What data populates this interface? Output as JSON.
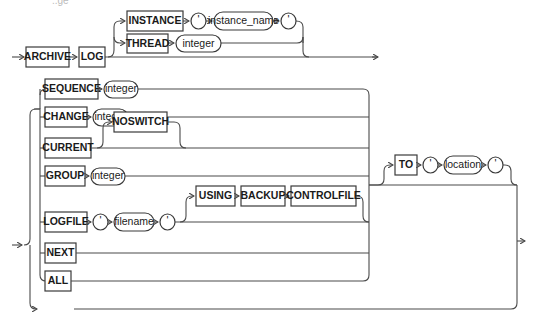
{
  "diagram": {
    "top_fragment": "..ge",
    "header": {
      "keywords": [
        "ARCHIVE",
        "LOG"
      ],
      "instance_branch": {
        "keyword": "INSTANCE",
        "open_quote": "'",
        "variable": "instance_name",
        "close_quote": "'"
      },
      "thread_branch": {
        "keyword": "THREAD",
        "variable": "integer"
      }
    },
    "clauses": {
      "sequence": {
        "keyword": "SEQUENCE",
        "variable": "integer"
      },
      "change": {
        "keyword": "CHANGE",
        "variable": "integer"
      },
      "current": {
        "keyword": "CURRENT",
        "option": "NOSWITCH"
      },
      "group": {
        "keyword": "GROUP",
        "variable": "integer"
      },
      "logfile": {
        "keyword": "LOGFILE",
        "open_quote": "'",
        "variable": "filename",
        "close_quote": "'",
        "using": "USING",
        "backup": "BACKUP",
        "controlfile": "CONTROLFILE"
      },
      "next": {
        "keyword": "NEXT"
      },
      "all": {
        "keyword": "ALL"
      },
      "start": {
        "keyword": "START"
      },
      "stop": {
        "keyword": "STOP"
      }
    },
    "to_clause": {
      "keyword": "TO",
      "open_quote": "'",
      "variable": "location",
      "close_quote": "'"
    }
  }
}
